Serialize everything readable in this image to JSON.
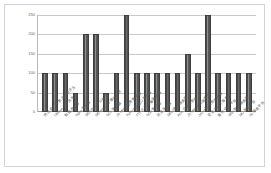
{
  "chart_data": {
    "type": "bar",
    "title": "",
    "xlabel": "",
    "ylabel": "",
    "ylim": [
      0,
      250
    ],
    "yticks": [
      "0",
      "50",
      "100",
      "150",
      "200",
      "250"
    ],
    "grid": true,
    "legend": "none",
    "bar_color": "#595959",
    "plot_border_color": "#d3d3d3",
    "gridline_color": "#c9c9c9",
    "categories": [
      "供应商、研发方、测评方",
      "Ultimus 工作流平台",
      "数据库平台",
      "Nginx 服务器",
      "MS Office 办公软件",
      "MS Windows 操作系统",
      "NCV 服务器",
      "JN MnnP 应用服务器",
      "Pythonrpc 接口服务器",
      "FTP 文件传输服务器",
      "NCU 客户端",
      "消息服务器",
      "MRU 通讯服务器",
      "Acm 应用服务器",
      "JN Mab 信息服务器",
      "Jmcrd 数据库服务器",
      "安全中间件服务器",
      "备份 中心平台",
      "MNN 数据服务器",
      "MU 服务平台",
      "NL 服务平台"
    ],
    "values": [
      100,
      100,
      100,
      50,
      200,
      200,
      50,
      100,
      250,
      100,
      100,
      100,
      100,
      100,
      150,
      100,
      250,
      100,
      100,
      100,
      100
    ]
  }
}
